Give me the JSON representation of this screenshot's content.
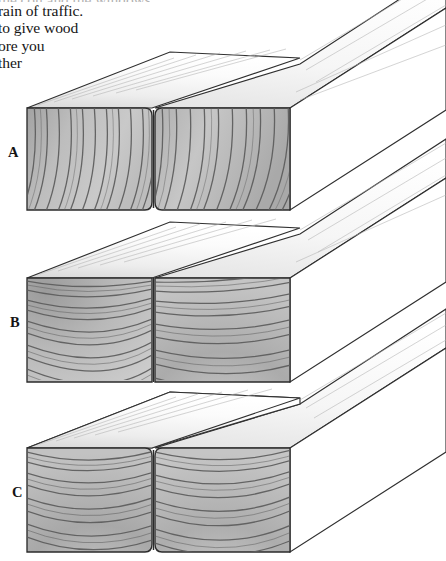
{
  "document": {
    "kind": "scanned-book-page-figure",
    "page_background": "#ffffff",
    "caption": {
      "cut_off_at_left_margin": true,
      "lines": [
        "the con    and the windows",
        "rain of traffic.",
        "to give wood",
        "ore you",
        "ther"
      ]
    }
  },
  "figure": {
    "projection": "two-point-ish oblique, beams recede to upper right",
    "labels": [
      {
        "id": "A",
        "text": "A",
        "x": 8,
        "y": 144
      },
      {
        "id": "B",
        "text": "B",
        "x": 10,
        "y": 314
      },
      {
        "id": "C",
        "text": "C",
        "x": 12,
        "y": 484
      }
    ],
    "colors": {
      "paper": "#ffffff",
      "endgrain_fill_light": "#cfcfcf",
      "endgrain_fill_mid": "#b6b6b6",
      "endgrain_fill_dark": "#9d9d9d",
      "ring_line": "#585858",
      "outline": "#2b2b2b",
      "top_face": "#fdfdfd",
      "top_face_grain": "#a9a9a9",
      "side_face": "#ffffff",
      "text": "#161616"
    },
    "groups": [
      {
        "id": "A",
        "label": "A",
        "description": "Both beams show steep diagonal growth rings running lower-left to upper-right (rift / bastard sawn), rings nearly parallel across both pieces.",
        "endface_top_y": 108,
        "endface_bottom_y": 210,
        "left_piece": {
          "x0": 27,
          "x1": 152,
          "ring_style": "diagonal-parallel",
          "ring_count": 13,
          "ring_tilt_deg": 62,
          "shade": "dark-left-to-light-right"
        },
        "right_piece": {
          "x0": 155,
          "x1": 290,
          "ring_style": "diagonal-parallel",
          "ring_count": 14,
          "ring_tilt_deg": 62,
          "shade": "light-centre"
        }
      },
      {
        "id": "B",
        "label": "B",
        "description": "Left beam rings arc gently from upper-left; right beam shows broad concentric arcs whose centre sits below the face (flat sawn / plain sawn).",
        "endface_top_y": 358,
        "endface_bottom_y": 688,
        "left_piece": {
          "x0": 27,
          "x1": 152,
          "ring_style": "sweeping-arc",
          "ring_count": 14,
          "shade": "dark-upper-left"
        },
        "right_piece": {
          "x0": 155,
          "x1": 290,
          "ring_style": "concentric-arc",
          "ring_count": 15,
          "shade": "dark-centre"
        }
      },
      {
        "id": "C",
        "label": "C",
        "description": "Both beams show strong concentric growth rings curving around a pith point below each face (true flat sawn pair).",
        "endface_top_y": 448,
        "endface_bottom_y": 552,
        "left_piece": {
          "x0": 27,
          "x1": 152,
          "ring_style": "concentric-arc",
          "ring_count": 15,
          "shade": "dark-centre"
        },
        "right_piece": {
          "x0": 155,
          "x1": 290,
          "ring_style": "concentric-arc",
          "ring_count": 16,
          "shade": "dark-centre"
        }
      }
    ],
    "perspective": {
      "recede_dx": 150,
      "recede_dy": -96,
      "note": "long beam faces extend off the right/top edge of the frame"
    }
  }
}
